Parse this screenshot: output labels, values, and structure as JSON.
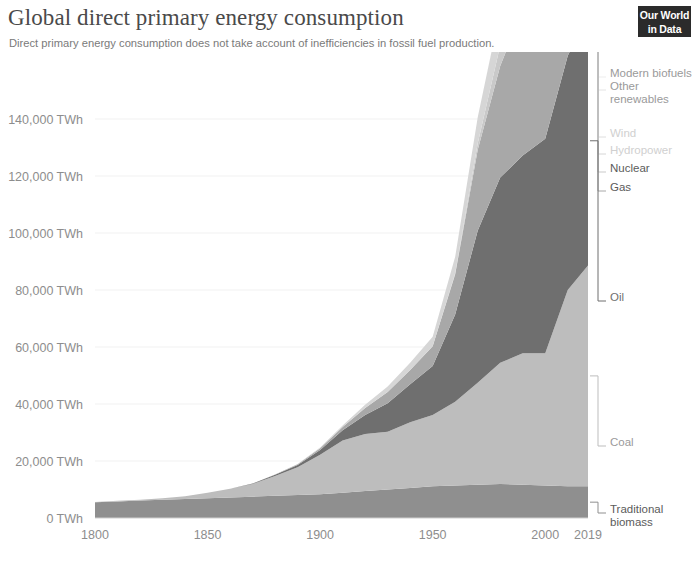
{
  "header": {
    "title": "Global direct primary energy consumption",
    "subtitle": "Direct primary energy consumption does not take account of inefficiencies in fossil fuel production.",
    "logo_line1": "Our World",
    "logo_line2": "in Data"
  },
  "chart_data": {
    "type": "area",
    "stacked": true,
    "title": "Global direct primary energy consumption",
    "subtitle": "Direct primary energy consumption does not take account of inefficiencies in fossil fuel production.",
    "xlabel": "",
    "ylabel": "",
    "unit": "TWh",
    "grid": true,
    "legend_position": "right-inline",
    "xlim": [
      1800,
      2019
    ],
    "ylim": [
      0,
      160000
    ],
    "x_ticks": [
      "1800",
      "1850",
      "1900",
      "1950",
      "2000",
      "2019"
    ],
    "x_tick_values": [
      1800,
      1850,
      1900,
      1950,
      2000,
      2019
    ],
    "y_ticks": [
      "0 TWh",
      "20,000 TWh",
      "40,000 TWh",
      "60,000 TWh",
      "80,000 TWh",
      "100,000 TWh",
      "120,000 TWh",
      "140,000 TWh"
    ],
    "y_tick_values": [
      0,
      20000,
      40000,
      60000,
      80000,
      100000,
      120000,
      140000
    ],
    "x": [
      1800,
      1810,
      1820,
      1830,
      1840,
      1850,
      1860,
      1870,
      1880,
      1890,
      1900,
      1910,
      1920,
      1930,
      1940,
      1950,
      1960,
      1970,
      1980,
      1990,
      2000,
      2010,
      2019
    ],
    "series": [
      {
        "name": "Traditional biomass",
        "color": "#8f8f8f",
        "label_color": "#5b5b5b",
        "values": [
          5556,
          5833,
          6111,
          6389,
          6667,
          6944,
          7222,
          7500,
          7778,
          8056,
          8333,
          8889,
          9444,
          10000,
          10556,
          11111,
          11389,
          11667,
          11944,
          11667,
          11389,
          11111,
          11111
        ]
      },
      {
        "name": "Coal",
        "color": "#bdbdbd",
        "label_color": "#9a9a9a",
        "values": [
          97,
          194,
          306,
          556,
          1000,
          1944,
          3056,
          4444,
          6944,
          9722,
          13889,
          18333,
          20000,
          20278,
          23056,
          25000,
          29444,
          35833,
          42500,
          46111,
          46389,
          68889,
          77500
        ]
      },
      {
        "name": "Oil",
        "color": "#6f6f6f",
        "label_color": "#6f6f6f",
        "values": [
          0,
          0,
          0,
          0,
          0,
          0,
          28,
          139,
          417,
          833,
          1667,
          3611,
          6667,
          10000,
          13333,
          17222,
          30556,
          53333,
          65000,
          69444,
          75278,
          82222,
          87500
        ]
      },
      {
        "name": "Gas",
        "color": "#a8a8a8",
        "label_color": "#5b5b5b",
        "values": [
          0,
          0,
          0,
          0,
          0,
          0,
          0,
          28,
          83,
          278,
          556,
          1111,
          2500,
          3889,
          5000,
          6944,
          14167,
          28333,
          39167,
          51111,
          60000,
          72222,
          80000
        ]
      },
      {
        "name": "Nuclear",
        "color": "#c9c9c9",
        "label_color": "#5b5b5b",
        "values": [
          0,
          0,
          0,
          0,
          0,
          0,
          0,
          0,
          0,
          0,
          0,
          0,
          0,
          0,
          0,
          0,
          278,
          2222,
          7222,
          12222,
          14167,
          14167,
          13611
        ]
      },
      {
        "name": "Hydropower",
        "color": "#d6d6d6",
        "label_color": "#d0d0d0",
        "values": [
          0,
          0,
          0,
          0,
          0,
          0,
          0,
          0,
          28,
          83,
          278,
          556,
          1111,
          1944,
          2500,
          3333,
          5833,
          9167,
          12222,
          15000,
          17500,
          21667,
          25000
        ]
      },
      {
        "name": "Wind",
        "color": "#dedede",
        "label_color": "#d0d0d0",
        "values": [
          0,
          0,
          0,
          0,
          0,
          0,
          0,
          0,
          0,
          0,
          0,
          0,
          0,
          0,
          0,
          0,
          0,
          0,
          0,
          111,
          833,
          3333,
          9722
        ]
      },
      {
        "name": "Other renewables",
        "color": "#e4e4e4",
        "label_color": "#9a9a9a",
        "values": [
          0,
          0,
          0,
          0,
          0,
          0,
          0,
          0,
          0,
          0,
          0,
          0,
          0,
          0,
          0,
          0,
          0,
          0,
          278,
          833,
          1667,
          3333,
          7222
        ]
      },
      {
        "name": "Modern biofuels",
        "color": "#ededed",
        "label_color": "#9a9a9a",
        "values": [
          0,
          0,
          0,
          0,
          0,
          0,
          0,
          0,
          0,
          0,
          0,
          0,
          0,
          0,
          0,
          0,
          0,
          0,
          0,
          278,
          1111,
          2500,
          4444
        ]
      }
    ],
    "legend_entries": [
      {
        "name": "Modern biofuels",
        "label": "Modern biofuels",
        "color": "#ededed",
        "label_color": "#9a9a9a"
      },
      {
        "name": "Other renewables",
        "label": "Other",
        "label2": "renewables",
        "color": "#e4e4e4",
        "label_color": "#9a9a9a"
      },
      {
        "name": "Wind",
        "label": "Wind",
        "color": "#dedede",
        "label_color": "#d0d0d0"
      },
      {
        "name": "Hydropower",
        "label": "Hydropower",
        "color": "#d6d6d6",
        "label_color": "#d0d0d0"
      },
      {
        "name": "Nuclear",
        "label": "Nuclear",
        "color": "#c9c9c9",
        "label_color": "#5b5b5b"
      },
      {
        "name": "Gas",
        "label": "Gas",
        "color": "#a8a8a8",
        "label_color": "#5b5b5b"
      },
      {
        "name": "Oil",
        "label": "Oil",
        "color": "#6f6f6f",
        "label_color": "#6f6f6f"
      },
      {
        "name": "Coal",
        "label": "Coal",
        "color": "#bdbdbd",
        "label_color": "#9a9a9a"
      },
      {
        "name": "Traditional biomass",
        "label": "Traditional",
        "label2": "biomass",
        "color": "#8f8f8f",
        "label_color": "#5b5b5b"
      }
    ]
  }
}
